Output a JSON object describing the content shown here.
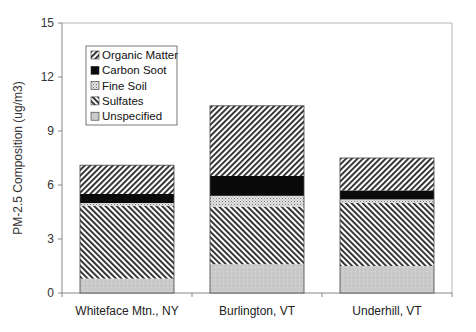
{
  "chart_data": {
    "type": "bar",
    "stacked": true,
    "title": "",
    "xlabel": "",
    "ylabel": "PM-2.5 Composition (ug/m3)",
    "ylim": [
      0,
      15
    ],
    "yticks": [
      0,
      3,
      6,
      9,
      12,
      15
    ],
    "grid": false,
    "legend_position": "upper-left-inside",
    "categories": [
      "Whiteface Mtn., NY",
      "Burlington, VT",
      "Underhill, VT"
    ],
    "series": [
      {
        "name": "Unspecified",
        "pattern": "light-gray-stipple",
        "values": [
          0.8,
          1.6,
          1.5
        ]
      },
      {
        "name": "Sulfates",
        "pattern": "forward-hatch",
        "values": [
          4.05,
          3.2,
          3.5
        ]
      },
      {
        "name": "Fine Soil",
        "pattern": "dotted",
        "values": [
          0.15,
          0.6,
          0.2
        ]
      },
      {
        "name": "Carbon Soot",
        "pattern": "solid-black",
        "values": [
          0.5,
          1.1,
          0.5
        ]
      },
      {
        "name": "Organic Matter",
        "pattern": "back-hatch",
        "values": [
          1.6,
          3.9,
          1.8
        ]
      }
    ],
    "totals": [
      7.1,
      10.4,
      7.5
    ],
    "legend_order": [
      "Organic Matter",
      "Carbon Soot",
      "Fine Soil",
      "Sulfates",
      "Unspecified"
    ]
  },
  "colors": {
    "axis": "#888888",
    "hatch": "#222222",
    "unspecified": "#c8c8c8",
    "carbon": "#0a0a0a",
    "fine_soil": "#bdbdbd"
  }
}
